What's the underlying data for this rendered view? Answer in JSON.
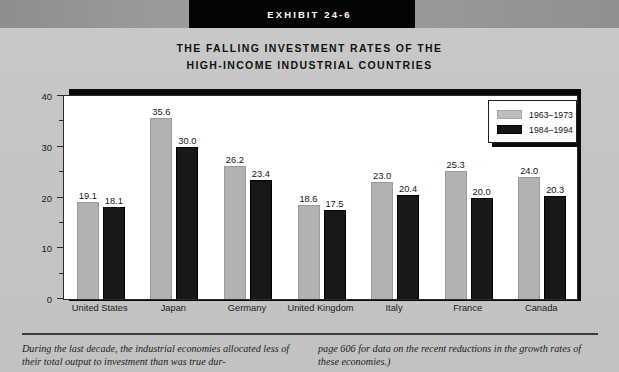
{
  "header": {
    "exhibit_label": "EXHIBIT 24-6"
  },
  "chart_title_line1": "THE FALLING INVESTMENT RATES OF THE",
  "chart_title_line2": "HIGH-INCOME INDUSTRIAL COUNTRIES",
  "legend": {
    "series1_label": "1963–1973",
    "series2_label": "1984–1994",
    "series1_color": "#b2b2b2",
    "series2_color": "#181818"
  },
  "axis": {
    "y_title": "Investment as a share of GDP",
    "y_ticks": [
      "0",
      "10",
      "20",
      "30",
      "40"
    ]
  },
  "caption": {
    "left": "During the last decade, the industrial economies allocated less of their total output to investment than was true dur-",
    "right": "page 606 for data on the recent reductions in the growth rates of these economies.)"
  },
  "chart_data": {
    "type": "bar",
    "title": "THE FALLING INVESTMENT RATES OF THE HIGH-INCOME INDUSTRIAL COUNTRIES",
    "xlabel": "",
    "ylabel": "Investment as a share of GDP",
    "ylim": [
      0,
      40
    ],
    "ytick_values": [
      0,
      10,
      20,
      30,
      40
    ],
    "yminor_tick_values": [
      5,
      15,
      25,
      35
    ],
    "grid": false,
    "legend_position": "top-right",
    "categories": [
      "United States",
      "Japan",
      "Germany",
      "United Kingdom",
      "Italy",
      "France",
      "Canada"
    ],
    "series": [
      {
        "name": "1963–1973",
        "color": "#b2b2b2",
        "values": [
          19.1,
          35.6,
          26.2,
          18.6,
          23.0,
          25.3,
          24.0
        ]
      },
      {
        "name": "1984–1994",
        "color": "#181818",
        "values": [
          18.1,
          30.0,
          23.4,
          17.5,
          20.4,
          20.0,
          20.3
        ]
      }
    ],
    "value_labels": [
      [
        "19.1",
        "18.1"
      ],
      [
        "35.6",
        "30.0"
      ],
      [
        "26.2",
        "23.4"
      ],
      [
        "18.6",
        "17.5"
      ],
      [
        "23.0",
        "20.4"
      ],
      [
        "25.3",
        "20.0"
      ],
      [
        "24.0",
        "20.3"
      ]
    ]
  }
}
